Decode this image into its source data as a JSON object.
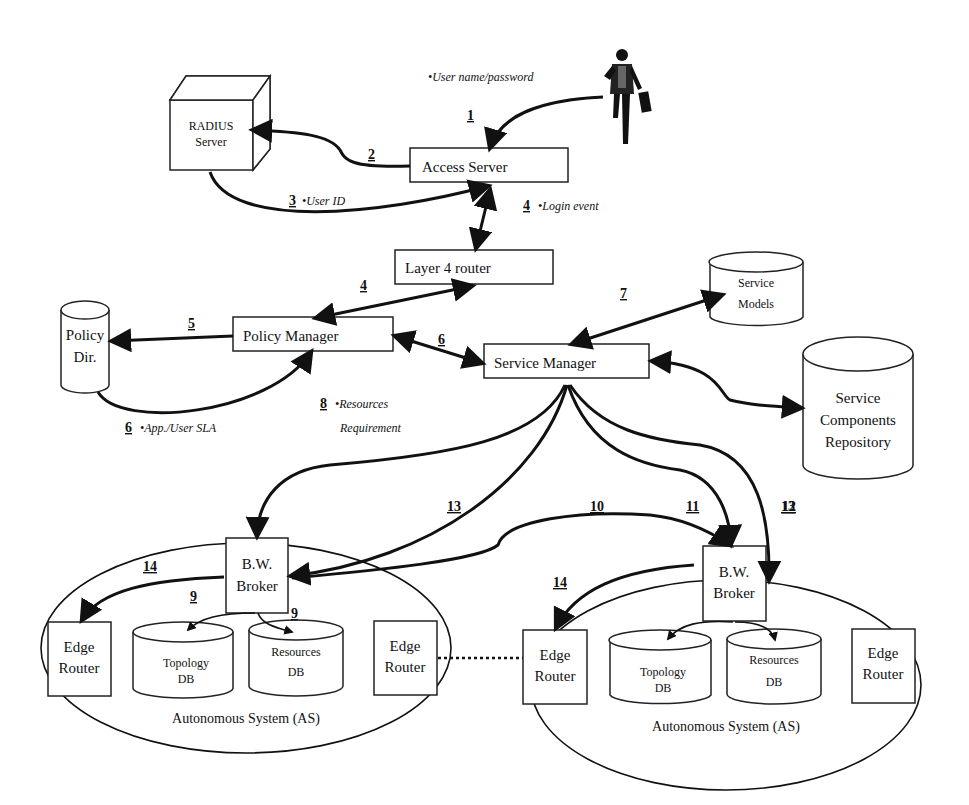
{
  "nodes": {
    "radius": {
      "line1": "RADIUS",
      "line2": "Server"
    },
    "access_server": {
      "label": "Access Server"
    },
    "layer4_router": {
      "label": "Layer 4 router"
    },
    "policy_dir": {
      "line1": "Policy",
      "line2": "Dir."
    },
    "policy_manager": {
      "label": "Policy Manager"
    },
    "service_manager": {
      "label": "Service Manager"
    },
    "service_models": {
      "line1": "Service",
      "line2": "Models"
    },
    "service_components": {
      "line1": "Service",
      "line2": "Components",
      "line3": "Repository"
    },
    "as_left": {
      "bw_broker": {
        "line1": "B.W.",
        "line2": "Broker"
      },
      "edge_router_left": {
        "line1": "Edge",
        "line2": "Router"
      },
      "edge_router_right": {
        "line1": "Edge",
        "line2": "Router"
      },
      "topology_db": {
        "line1": "Topology",
        "line2": "DB"
      },
      "resources_db": {
        "line1": "Resources",
        "line2": "DB"
      },
      "label": "Autonomous System (AS)"
    },
    "as_right": {
      "bw_broker": {
        "line1": "B.W.",
        "line2": "Broker"
      },
      "edge_router_left": {
        "line1": "Edge",
        "line2": "Router"
      },
      "edge_router_right": {
        "line1": "Edge",
        "line2": "Router"
      },
      "topology_db": {
        "line1": "Topology",
        "line2": "DB"
      },
      "resources_db": {
        "line1": "Resources",
        "line2": "DB"
      },
      "label": "Autonomous System (AS)"
    }
  },
  "steps": {
    "s1": "1",
    "s2": "2",
    "s3": "3",
    "s4a": "4",
    "s4b": "4",
    "s5": "5",
    "s6a": "6",
    "s6b": "6",
    "s7": "7",
    "s8": "8",
    "s9a": "9",
    "s9b": "9",
    "s10": "10",
    "s11": "11",
    "s12": "12",
    "s13a": "13",
    "s13b": "13",
    "s14a": "14",
    "s14b": "14"
  },
  "annotations": {
    "user_pass": "•User name/password",
    "user_id": "•User ID",
    "login_event": "•Login event",
    "app_sla": "•App./User SLA",
    "resources_line1": "•Resources",
    "resources_line2": "Requirement"
  },
  "icons": {
    "user": "businessman-figure-icon"
  }
}
